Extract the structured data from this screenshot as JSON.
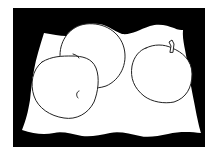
{
  "image": {
    "description": "Black and white line drawing of three apples resting on a white cloth against a black background",
    "subject": "still life with apples",
    "colors": {
      "background": "#ffffff",
      "frame": "#000000",
      "cloth": "#ffffff",
      "outline": "#222222"
    },
    "objects": [
      {
        "name": "back-apple",
        "label": "apple"
      },
      {
        "name": "front-left-apple",
        "label": "apple"
      },
      {
        "name": "right-apple",
        "label": "apple with stem"
      },
      {
        "name": "cloth",
        "label": "white draped cloth"
      }
    ]
  }
}
